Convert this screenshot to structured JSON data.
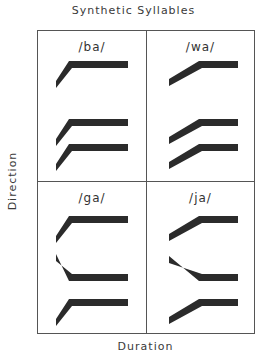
{
  "title": "Synthetic Syllables",
  "xlabel": "Duration",
  "ylabel": "Direction",
  "colors": {
    "ink": "#2b2b2b",
    "border": "#555555",
    "background": "#ffffff"
  },
  "panels": [
    {
      "label": "/ba/",
      "transition": "short",
      "formants": [
        {
          "start": -1,
          "end": 0
        },
        {
          "start": -1,
          "end": 0
        },
        {
          "start": -1,
          "end": 0
        }
      ]
    },
    {
      "label": "/wa/",
      "transition": "long",
      "formants": [
        {
          "start": -1,
          "end": 0
        },
        {
          "start": -1,
          "end": 0
        },
        {
          "start": -1,
          "end": 0
        }
      ]
    },
    {
      "label": "/ga/",
      "transition": "short",
      "formants": [
        {
          "start": -1,
          "end": 0
        },
        {
          "start": 1,
          "end": 0
        },
        {
          "start": -1,
          "end": 0
        }
      ]
    },
    {
      "label": "/ja/",
      "transition": "long",
      "formants": [
        {
          "start": -1,
          "end": 0
        },
        {
          "start": 1,
          "end": 0
        },
        {
          "start": -1,
          "end": 0
        }
      ]
    }
  ]
}
